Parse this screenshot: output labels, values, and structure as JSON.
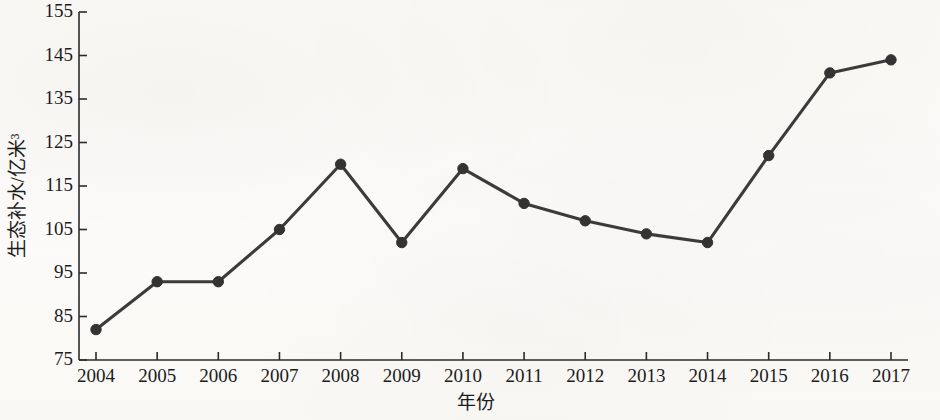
{
  "chart_data": {
    "type": "line",
    "title": "",
    "xlabel": "年份",
    "ylabel": "生态补水/亿米³",
    "categories": [
      "2004",
      "2005",
      "2006",
      "2007",
      "2008",
      "2009",
      "2010",
      "2011",
      "2012",
      "2013",
      "2014",
      "2015",
      "2016",
      "2017"
    ],
    "values": [
      82,
      93,
      93,
      105,
      120,
      102,
      119,
      111,
      107,
      104,
      102,
      122,
      141,
      144
    ],
    "series": [
      {
        "name": "生态补水",
        "values": [
          82,
          93,
          93,
          105,
          120,
          102,
          119,
          111,
          107,
          104,
          102,
          122,
          141,
          144
        ]
      }
    ],
    "ylim": [
      75,
      155
    ],
    "yticks": [
      75,
      85,
      95,
      105,
      115,
      125,
      135,
      145,
      155
    ],
    "ytick_labels": [
      "75",
      "85",
      "95",
      "105",
      "115",
      "125",
      "135",
      "145",
      "155"
    ],
    "xtick_labels": [
      "2004",
      "2005",
      "2006",
      "2007",
      "2008",
      "2009",
      "2010",
      "2011",
      "2012",
      "2013",
      "2014",
      "2015",
      "2016",
      "2017"
    ],
    "grid": false,
    "legend": "none",
    "marker": "circle",
    "line_color": "#3b3b3b",
    "marker_color": "#333333",
    "background_color": "#fbfaf8"
  },
  "axes": {
    "y_title": "生态补水/亿米³",
    "x_title": "年份"
  }
}
